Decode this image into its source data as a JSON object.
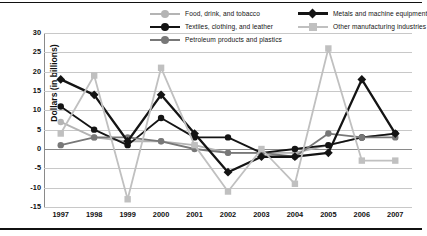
{
  "chart_data": {
    "type": "line",
    "title": "",
    "xlabel": "",
    "ylabel": "Dollars (in billions)",
    "categories": [
      "1997",
      "1998",
      "1999",
      "2000",
      "2001",
      "2002",
      "2003",
      "2004",
      "2005",
      "2006",
      "2007"
    ],
    "ylim": [
      -15,
      30
    ],
    "ytick_values": [
      30,
      25,
      20,
      15,
      10,
      5,
      0,
      -5,
      -10,
      -15
    ],
    "ytick_labels": [
      "30",
      "25",
      "20",
      "15",
      "10",
      "5",
      "0",
      "-5",
      "-10",
      "-15"
    ],
    "grid": true,
    "legend_position": "top",
    "series": [
      {
        "name": "Food, drink, and tobacco",
        "color": "#b4b4b4",
        "marker": "circle",
        "values": [
          7,
          3,
          2,
          2,
          1,
          -1,
          -1,
          -1,
          1,
          3,
          4
        ]
      },
      {
        "name": "Textiles, clothing, and leather",
        "color": "#141414",
        "marker": "circle",
        "values": [
          11,
          5,
          1,
          8,
          3,
          3,
          -1,
          0,
          1,
          3,
          4
        ]
      },
      {
        "name": "Petroleum products and plastics",
        "color": "#787878",
        "marker": "circle",
        "values": [
          1,
          3,
          3,
          2,
          0,
          -1,
          -1,
          -2,
          4,
          3,
          3
        ]
      },
      {
        "name": "Metals and machine equipment",
        "color": "#141414",
        "marker": "diamond",
        "values": [
          18,
          14,
          2,
          14,
          4,
          -6,
          -2,
          -2,
          -1,
          18,
          4
        ]
      },
      {
        "name": "Other manufacturing industries",
        "color": "#c0c0c0",
        "marker": "square",
        "values": [
          4,
          19,
          -13,
          21,
          1,
          -11,
          0,
          -9,
          26,
          -3,
          -3
        ]
      }
    ]
  }
}
